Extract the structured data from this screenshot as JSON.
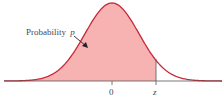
{
  "figure": {
    "type": "normal-distribution-diagram",
    "label": "Probability",
    "label_var": "p",
    "tick_center": "0",
    "tick_z": "z",
    "colors": {
      "fill": "#f7b2b2",
      "curve": "#c8283a",
      "axis": "#555555",
      "text": "#444a55"
    }
  },
  "chart_data": {
    "type": "area",
    "title": "",
    "xlabel": "",
    "ylabel": "",
    "x_ticks": [
      "0",
      "z"
    ],
    "shaded_region": {
      "from": "-inf",
      "to": "z"
    },
    "annotations": [
      "Probability p"
    ],
    "z_value_approx": 0.9,
    "grid": false
  }
}
